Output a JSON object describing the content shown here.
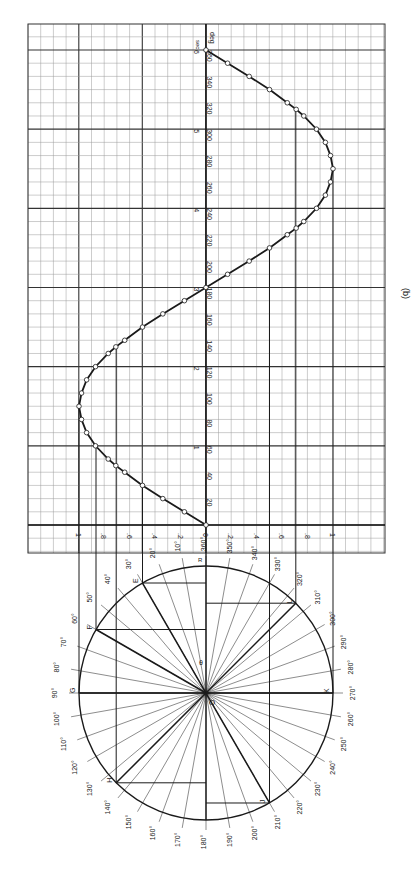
{
  "figure": {
    "caption": "(b)",
    "colors": {
      "ink": "#1a1a1a",
      "grid_minor": "#9a9a9a",
      "grid_major": "#333333",
      "paper": "#ffffff"
    }
  },
  "circle": {
    "center_label": "O",
    "angle_symbol": "θ",
    "radius_start_label": "R",
    "point_labels": [
      "A",
      "B",
      "C",
      "D",
      "E",
      "F",
      "G",
      "H",
      "J",
      "K",
      "L"
    ],
    "angle_labels": [
      "360°",
      "10°",
      "20°",
      "30°",
      "40°",
      "50°",
      "60°",
      "70°",
      "80°",
      "90°",
      "100°",
      "110°",
      "120°",
      "130°",
      "140°",
      "150°",
      "160°",
      "170°",
      "180°",
      "190°",
      "200°",
      "210°",
      "220°",
      "230°",
      "240°",
      "250°",
      "260°",
      "270°",
      "280°",
      "290°",
      "300°",
      "310°",
      "320°",
      "330°",
      "340°",
      "350°"
    ]
  },
  "chart_data": {
    "type": "line",
    "title": "",
    "caption": "(b)",
    "xlabel": "deg",
    "x2label": "sec",
    "ylabel": "",
    "x": [
      0,
      10,
      20,
      30,
      40,
      45,
      50,
      60,
      70,
      80,
      90,
      100,
      110,
      120,
      130,
      135,
      140,
      150,
      160,
      170,
      180,
      190,
      200,
      210,
      220,
      225,
      230,
      240,
      250,
      260,
      270,
      280,
      290,
      300,
      310,
      315,
      320,
      330,
      340,
      350,
      360
    ],
    "values": [
      0,
      0.17,
      0.34,
      0.5,
      0.64,
      0.71,
      0.77,
      0.87,
      0.94,
      0.98,
      1,
      0.98,
      0.94,
      0.87,
      0.77,
      0.71,
      0.64,
      0.5,
      0.34,
      0.17,
      0,
      -0.17,
      -0.34,
      -0.5,
      -0.64,
      -0.71,
      -0.77,
      -0.87,
      -0.94,
      -0.98,
      -1,
      -0.98,
      -0.94,
      -0.87,
      -0.77,
      -0.71,
      -0.64,
      -0.5,
      -0.34,
      -0.17,
      0
    ],
    "xlim": [
      0,
      360
    ],
    "ylim": [
      -1,
      1
    ],
    "deg_ticks": [
      "20",
      "40",
      "60",
      "80",
      "100",
      "120",
      "140",
      "160",
      "180",
      "200",
      "220",
      "240",
      "260",
      "280",
      "300",
      "320",
      "340",
      "360"
    ],
    "sec_ticks": [
      "0",
      "1",
      "2",
      "3",
      "4",
      "5",
      "6"
    ],
    "amplitude_ticks": [
      "1",
      ".8",
      ".6",
      ".4",
      ".2",
      "0",
      ".2",
      ".4",
      ".6",
      ".8",
      "1"
    ],
    "grid": true
  }
}
